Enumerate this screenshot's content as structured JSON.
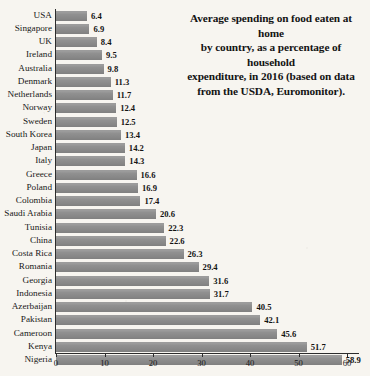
{
  "chart_data": {
    "type": "bar",
    "orientation": "horizontal",
    "title": "Average spending on food eaten at home by country, as a percentage of household expenditure, in 2016 (based on data from the USDA, Euromonitor).",
    "title_lines": [
      "Average spending on food eaten at home",
      "by country, as a percentage of household",
      "expenditure, in 2016 (based on data",
      "from the USDA, Euromonitor)."
    ],
    "xlabel": "",
    "ylabel": "",
    "xlim": [
      0,
      62
    ],
    "xticks": [
      0,
      10,
      20,
      30,
      40,
      50,
      60
    ],
    "xtick_labels": [
      "0",
      "10",
      "20",
      "30",
      "40",
      "50",
      "60"
    ],
    "grid": false,
    "legend": false,
    "bar_color": "#8e8e8e",
    "background_color": "#f7f5f0",
    "axis_color": "#2c2c2c",
    "categories": [
      "USA",
      "Singapore",
      "UK",
      "Ireland",
      "Australia",
      "Denmark",
      "Netherlands",
      "Norway",
      "Sweden",
      "South Korea",
      "Japan",
      "Italy",
      "Greece",
      "Poland",
      "Colombia",
      "Saudi Arabia",
      "Tunisia",
      "China",
      "Costa Rica",
      "Romania",
      "Georgia",
      "Indonesia",
      "Azerbaijan",
      "Pakistan",
      "Cameroon",
      "Kenya",
      "Nigeria"
    ],
    "values": [
      6.4,
      6.9,
      8.4,
      9.5,
      9.8,
      11.3,
      11.7,
      12.4,
      12.5,
      13.4,
      14.2,
      14.3,
      16.6,
      16.9,
      17.4,
      20.6,
      22.3,
      22.6,
      26.3,
      29.4,
      31.6,
      31.7,
      40.5,
      42.1,
      45.6,
      51.7,
      58.9
    ],
    "value_labels": [
      "6.4",
      "6.9",
      "8.4",
      "9.5",
      "9.8",
      "11.3",
      "11.7",
      "12.4",
      "12.5",
      "13.4",
      "14.2",
      "14.3",
      "16.6",
      "16.9",
      "17.4",
      "20.6",
      "22.3",
      "22.6",
      "26.3",
      "29.4",
      "31.6",
      "31.7",
      "40.5",
      "42.1",
      "45.6",
      "51.7",
      "58.9"
    ]
  }
}
